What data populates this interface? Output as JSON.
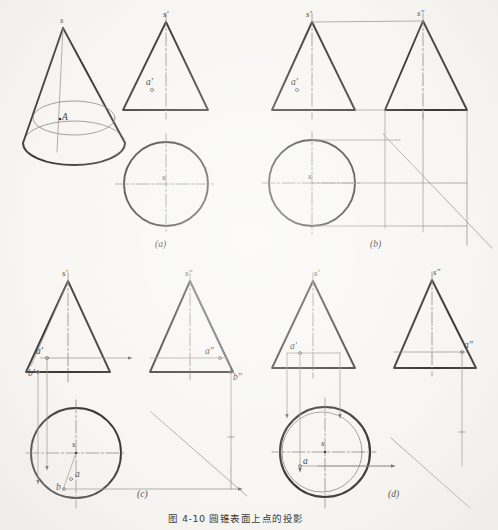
{
  "figure": {
    "caption": "图 4-10   圆锥表面上点的投影",
    "panels": [
      {
        "id": "a",
        "label": "(a)"
      },
      {
        "id": "b",
        "label": "(b)"
      },
      {
        "id": "c",
        "label": "(c)"
      },
      {
        "id": "d",
        "label": "(d)"
      }
    ]
  },
  "colors": {
    "paper": "#f7f6f3",
    "outline": "#3a3836",
    "thin": "#86837e",
    "center": "#8b8884",
    "text": "#3c3a38"
  },
  "panel_a": {
    "pictorial": {
      "apex_label": "s",
      "surface_point_label": "A"
    },
    "front_view": {
      "apex_label": "s'",
      "point_label": "a'"
    },
    "top_view": {
      "center_label": "s"
    }
  },
  "panel_b": {
    "front_view": {
      "apex_label": "s'",
      "point_label": "a'"
    },
    "side_view": {
      "apex_label": "s″"
    },
    "top_view": {
      "center_label": "s"
    }
  },
  "panel_c": {
    "front_view": {
      "apex_label": "s'",
      "point_a_label": "a'",
      "point_b_label": "b'"
    },
    "side_view": {
      "apex_label": "s″",
      "point_a_label": "a″",
      "point_b_label": "b″"
    },
    "top_view": {
      "center_label": "s",
      "point_a_label": "a",
      "point_b_label": "b"
    }
  },
  "panel_d": {
    "front_view": {
      "apex_label": "s'",
      "point_label": "a'"
    },
    "side_view": {
      "apex_label": "s″",
      "point_label": "a″"
    },
    "top_view": {
      "center_label": "s",
      "point_label": "a"
    }
  }
}
